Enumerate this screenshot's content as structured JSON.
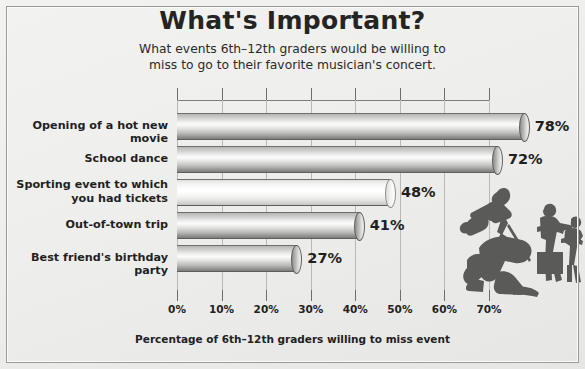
{
  "title": "What's Important?",
  "subtitle_line1": "What events 6th–12th graders would be willing to",
  "subtitle_line2": "miss to go to their favorite musician's concert.",
  "axis_caption": "Percentage of 6th–12th graders willing to miss event",
  "colors": {
    "background": "#eeeeec",
    "border": "#9a9a98",
    "bar_gray": "#b9b9b7",
    "bar_light": "#fafafa",
    "text": "#1f1f1f",
    "gridline": "#b8b8b6",
    "silhouette": "#5a5a58"
  },
  "illustration": {
    "name": "band-silhouette",
    "description": "silhouette of rock band with singer, guitarists and drums"
  },
  "chart_data": {
    "type": "bar",
    "orientation": "horizontal",
    "title": "What's Important?",
    "subtitle": "What events 6th–12th graders would be willing to miss to go to their favorite musician's concert.",
    "xlabel": "Percentage of 6th–12th graders willing to miss event",
    "ylabel": "",
    "xlim": [
      0,
      70
    ],
    "xticks": [
      0,
      10,
      20,
      30,
      40,
      50,
      60,
      70
    ],
    "xtick_labels": [
      "0%",
      "10%",
      "20%",
      "30%",
      "40%",
      "50%",
      "60%",
      "70%"
    ],
    "grid": true,
    "legend": false,
    "categories": [
      "Opening of a hot new movie",
      "School dance",
      "Sporting event to which you had tickets",
      "Out-of-town trip",
      "Best friend's birthday party"
    ],
    "category_lines": [
      [
        "Opening of a hot new movie"
      ],
      [
        "School dance"
      ],
      [
        "Sporting event to which",
        "you had tickets"
      ],
      [
        "Out-of-town trip"
      ],
      [
        "Best friend's birthday party"
      ]
    ],
    "values": [
      78,
      72,
      48,
      41,
      27
    ],
    "data_labels": [
      "78%",
      "72%",
      "48%",
      "41%",
      "27%"
    ],
    "bar_styles": [
      "gray",
      "gray",
      "light",
      "gray",
      "gray"
    ]
  }
}
